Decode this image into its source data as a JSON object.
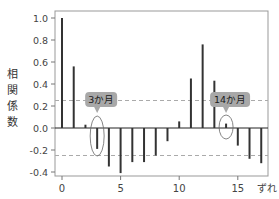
{
  "chart_data": {
    "type": "bar",
    "title": "",
    "xlabel": "ずれ",
    "ylabel": "相関係数",
    "x": [
      0,
      1,
      2,
      3,
      4,
      5,
      6,
      7,
      8,
      9,
      10,
      11,
      12,
      13,
      14,
      15,
      16,
      17
    ],
    "values": [
      1.0,
      0.56,
      0.03,
      -0.19,
      -0.35,
      -0.41,
      -0.31,
      -0.31,
      -0.25,
      -0.12,
      0.06,
      0.45,
      0.76,
      0.43,
      0.04,
      -0.16,
      -0.28,
      -0.32
    ],
    "xticks": [
      "0",
      "5",
      "10",
      "15"
    ],
    "yticks": [
      "1.0",
      "0.8",
      "0.6",
      "0.4",
      "0.2",
      "0.0",
      "-0.2",
      "-0.4"
    ],
    "ylim": [
      -0.45,
      1.07
    ],
    "xlim": [
      -0.6,
      17.6
    ],
    "confidence_bounds": [
      0.25,
      -0.25
    ],
    "grid": false,
    "annotations": [
      {
        "text": "3か月",
        "lag": 3
      },
      {
        "text": "14か月",
        "lag": 14
      }
    ]
  },
  "colors": {
    "bar": "#333333",
    "axis": "#999999",
    "dashed": "#aaaaaa",
    "callout_bg": "#a8a8a8",
    "callout_text": "#1a1a1a"
  }
}
